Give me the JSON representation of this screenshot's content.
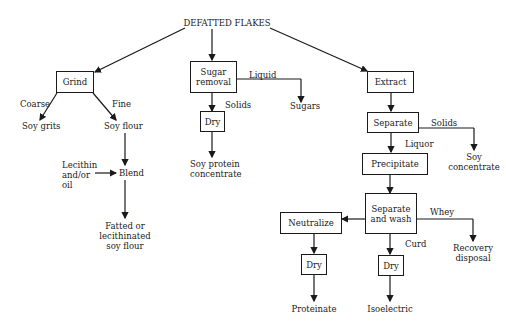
{
  "title": "DEFATTED FLAKES",
  "branches": {
    "flour": {
      "grind": "Grind",
      "coarse": "Coarse",
      "fine": "Fine",
      "soy_grits": "Soy grits",
      "soy_flour": "Soy flour",
      "lecithin": "Lecithin\nand/or\noil",
      "lecithin_l1": "Lecithin",
      "lecithin_l2": "and/or",
      "lecithin_l3": "oil",
      "blend": "Blend",
      "fatted_l1": "Fatted or",
      "fatted_l2": "lecithinated",
      "fatted_l3": "soy flour"
    },
    "concentrate": {
      "sugar_l1": "Sugar",
      "sugar_l2": "removal",
      "liquid": "Liquid",
      "sugars": "Sugars",
      "solids": "Solids",
      "dry": "Dry",
      "product_l1": "Soy protein",
      "product_l2": "concentrate"
    },
    "isolate": {
      "extract": "Extract",
      "separate": "Separate",
      "solids": "Solids",
      "soy_conc_l1": "Soy",
      "soy_conc_l2": "concentrate",
      "liquor": "Liquor",
      "precipitate": "Precipitate",
      "sepwash_l1": "Separate",
      "sepwash_l2": "and wash",
      "whey": "Whey",
      "recovery_l1": "Recovery",
      "recovery_l2": "disposal",
      "curd": "Curd",
      "neutralize": "Neutralize",
      "dry_left": "Dry",
      "dry_right": "Dry",
      "proteinate": "Proteinate",
      "isoelectric": "Isoelectric"
    }
  }
}
